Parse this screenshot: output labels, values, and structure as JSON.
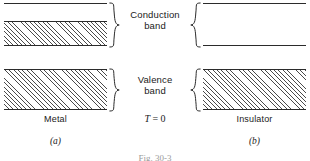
{
  "figure": {
    "caption": "Fig. 30-3",
    "temperature_label_symbol": "T",
    "temperature_label_value": " = 0",
    "band_labels": {
      "conduction_line1": "Conduction",
      "conduction_line2": "band",
      "valence_line1": "Valence",
      "valence_line2": "band"
    },
    "panels": [
      {
        "id": "a",
        "material": "Metal",
        "sublabel": "(a)",
        "conduction_band": {
          "state": "partially-filled",
          "fill_fraction": 0.55
        },
        "valence_band": {
          "state": "filled",
          "fill_fraction": 1.0
        }
      },
      {
        "id": "b",
        "material": "Insulator",
        "sublabel": "(b)",
        "conduction_band": {
          "state": "empty",
          "fill_fraction": 0.0
        },
        "valence_band": {
          "state": "filled",
          "fill_fraction": 1.0
        }
      }
    ],
    "colors": {
      "line": "#2b2b2b",
      "hatch": "#4a4a4a",
      "background": "#ffffff",
      "caption": "#9a9a9a"
    }
  }
}
